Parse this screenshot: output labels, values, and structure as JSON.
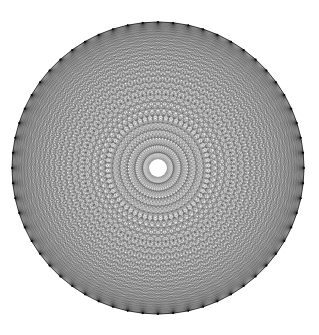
{
  "figure": {
    "title": "Complete graph K60 chord diagram",
    "type": "complete-graph-chord-diagram"
  },
  "canvas": {
    "width": 319,
    "height": 335,
    "background_color": "#ffffff"
  },
  "geometry": {
    "center_x": 158,
    "center_y": 168,
    "radius": 146,
    "vertex_count": 60,
    "start_angle_deg": -90,
    "center_hole_radius": 9,
    "rim_dark_cluster_count": 15
  },
  "style": {
    "chord_color": "#2b2b2b",
    "chord_opacity": 0.42,
    "chord_width": 0.35,
    "rim_color": "#111111",
    "rim_width": 0.8,
    "vertex_color": "#000000",
    "vertex_radius": 0.9,
    "center_hole_fill": "#ffffff"
  },
  "chart_data": {
    "type": "scatter",
    "title": "Complete graph K60 chord diagram",
    "subtitle": "",
    "xlabel": "",
    "ylabel": "",
    "xlim": [
      -1,
      1
    ],
    "ylim": [
      -1,
      1
    ],
    "grid": false,
    "legend": "none",
    "tick_labels": [],
    "annotations": [],
    "vertex_count": 60,
    "edge_count": 1770,
    "angle_step_deg": 6,
    "envelope_radii_fraction": [
      0.052,
      0.156,
      0.259,
      0.358,
      0.454,
      0.545,
      0.63,
      0.707,
      0.777,
      0.838,
      0.891,
      0.934,
      0.966,
      0.988,
      1.0
    ],
    "series": [
      {
        "name": "vertices",
        "values": [
          0,
          6,
          12,
          18,
          24,
          30,
          36,
          42,
          48,
          54,
          60,
          66,
          72,
          78,
          84,
          90,
          96,
          102,
          108,
          114,
          120,
          126,
          132,
          138,
          144,
          150,
          156,
          162,
          168,
          174,
          180,
          186,
          192,
          198,
          204,
          210,
          216,
          222,
          228,
          234,
          240,
          246,
          252,
          258,
          264,
          270,
          276,
          282,
          288,
          294,
          300,
          306,
          312,
          318,
          324,
          330,
          336,
          342,
          348,
          354
        ]
      }
    ]
  }
}
